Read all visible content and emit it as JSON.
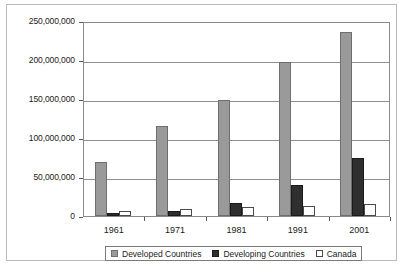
{
  "chart_data": {
    "type": "bar",
    "title": "",
    "xlabel": "",
    "ylabel": "",
    "categories": [
      "1961",
      "1971",
      "1981",
      "1991",
      "2001"
    ],
    "series": [
      {
        "name": "Developed Countries",
        "color": "#9a9a9a",
        "values": [
          69000000,
          116000000,
          149000000,
          198000000,
          236000000
        ]
      },
      {
        "name": "Developing Countries",
        "color": "#2f2f2f",
        "values": [
          4000000,
          7000000,
          17000000,
          40000000,
          74000000
        ]
      },
      {
        "name": "Canada",
        "color": "#ffffff",
        "values": [
          6000000,
          9000000,
          11000000,
          13000000,
          16000000
        ]
      }
    ],
    "ylim": [
      0,
      250000000
    ],
    "ytick_values": [
      250000000,
      200000000,
      150000000,
      100000000,
      50000000,
      0
    ],
    "ytick_labels": [
      "250,000,000",
      "200,000,000",
      "150,000,000",
      "100,000,000",
      "50,000,000",
      "0"
    ],
    "grid": true,
    "legend_position": "bottom"
  },
  "legend": {
    "items": [
      {
        "label": "Developed Countries"
      },
      {
        "label": "Developing Countries"
      },
      {
        "label": "Canada"
      }
    ]
  }
}
